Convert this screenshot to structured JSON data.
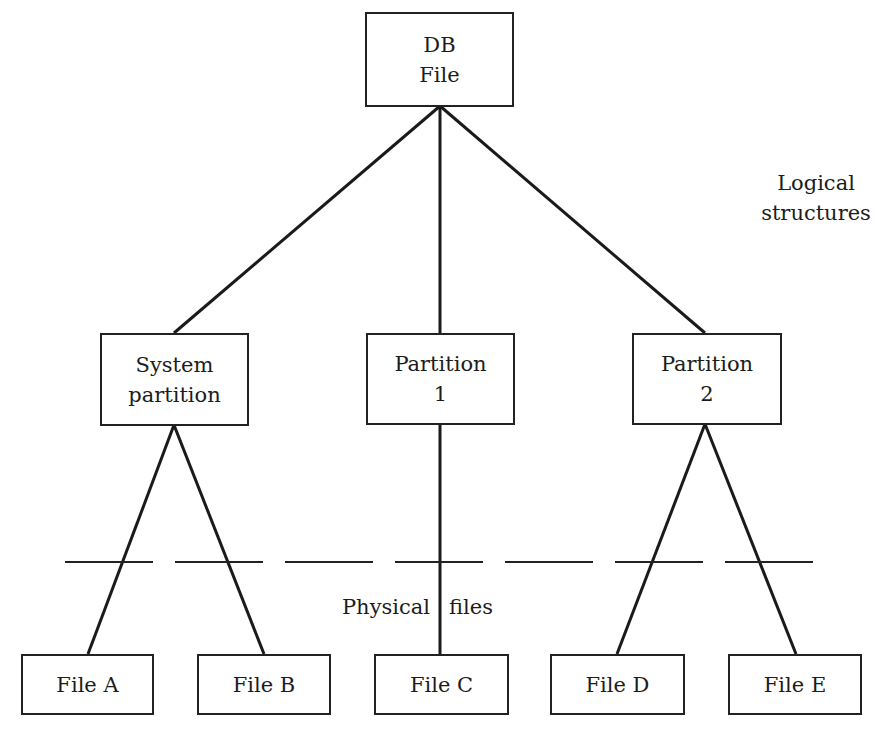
{
  "diagram": {
    "root": {
      "line1": "DB",
      "line2": "File"
    },
    "partitions": [
      {
        "line1": "System",
        "line2": "partition"
      },
      {
        "line1": "Partition",
        "line2": "1"
      },
      {
        "line1": "Partition",
        "line2": "2"
      }
    ],
    "files": [
      {
        "label": "File A"
      },
      {
        "label": "File B"
      },
      {
        "label": "File C"
      },
      {
        "label": "File D"
      },
      {
        "label": "File E"
      }
    ],
    "annotations": {
      "logical_line1": "Logical",
      "logical_line2": "structures",
      "physical_left": "Physical",
      "physical_right": "files"
    },
    "colors": {
      "stroke": "#222222",
      "background": "#ffffff"
    }
  }
}
